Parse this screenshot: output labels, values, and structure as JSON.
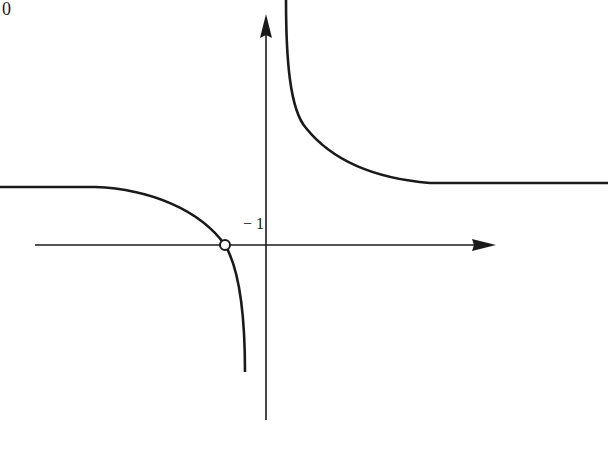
{
  "figure": {
    "corner_label": "0",
    "point_label": "− 1",
    "stroke_color": "#1a1a1a",
    "background": "#ffffff",
    "axes": {
      "x_axis": {
        "y": 245,
        "x_start": 35,
        "x_end": 495,
        "arrow": "right"
      },
      "y_axis": {
        "x": 266,
        "y_start": 420,
        "y_end": 15,
        "arrow": "up"
      }
    },
    "curves": [
      {
        "name": "upper-right-branch",
        "description": "descends from top near y-axis and levels off to horizontal asymptote"
      },
      {
        "name": "lower-left-branch",
        "description": "horizontal on the left, curves down through open point on x-axis toward vertical asymptote"
      }
    ],
    "open_point": {
      "x": 225,
      "y": 245,
      "label": "− 1"
    }
  }
}
